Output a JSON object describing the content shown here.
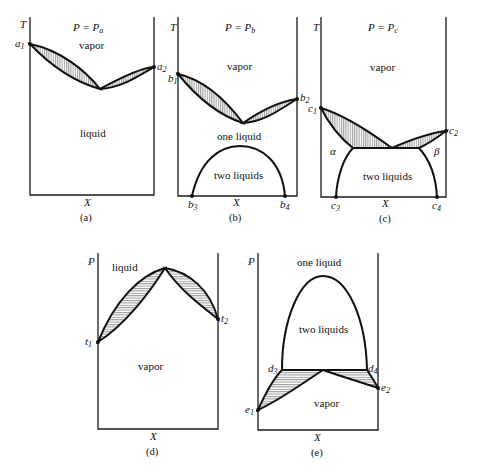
{
  "figure": {
    "panels": [
      {
        "id": "a",
        "caption": "(a)",
        "y_axis": "T",
        "x_axis": "X",
        "condition": {
          "lhs": "P = P",
          "sub": "a"
        },
        "regions": {
          "top": "vapor",
          "bottom": "liquid"
        },
        "points": [
          {
            "base": "a",
            "sub": "1"
          },
          {
            "base": "a",
            "sub": "2"
          }
        ]
      },
      {
        "id": "b",
        "caption": "(b)",
        "y_axis": "T",
        "x_axis": "X",
        "condition": {
          "lhs": "P = P",
          "sub": "b"
        },
        "regions": {
          "top": "vapor",
          "middle": "one liquid",
          "dome": "two liquids"
        },
        "points": [
          {
            "base": "b",
            "sub": "1"
          },
          {
            "base": "b",
            "sub": "2"
          },
          {
            "base": "b",
            "sub": "3"
          },
          {
            "base": "b",
            "sub": "4"
          }
        ]
      },
      {
        "id": "c",
        "caption": "(c)",
        "y_axis": "T",
        "x_axis": "X",
        "condition": {
          "lhs": "P = P",
          "sub": "c"
        },
        "regions": {
          "top": "vapor",
          "left": "α",
          "right": "β",
          "dome": "two liquids"
        },
        "points": [
          {
            "base": "c",
            "sub": "1"
          },
          {
            "base": "c",
            "sub": "2"
          },
          {
            "base": "c",
            "sub": "3"
          },
          {
            "base": "c",
            "sub": "4"
          }
        ]
      },
      {
        "id": "d",
        "caption": "(d)",
        "y_axis": "P",
        "x_axis": "X",
        "regions": {
          "top": "liquid",
          "bottom": "vapor"
        },
        "points": [
          {
            "base": "t",
            "sub": "1"
          },
          {
            "base": "t",
            "sub": "2"
          }
        ]
      },
      {
        "id": "e",
        "caption": "(e)",
        "y_axis": "P",
        "x_axis": "X",
        "regions": {
          "top": "one liquid",
          "dome": "two liquids",
          "bottom": "vapor"
        },
        "points": [
          {
            "base": "d",
            "sub": "3"
          },
          {
            "base": "d",
            "sub": "4"
          },
          {
            "base": "e",
            "sub": "1"
          },
          {
            "base": "e",
            "sub": "2"
          }
        ]
      }
    ]
  }
}
